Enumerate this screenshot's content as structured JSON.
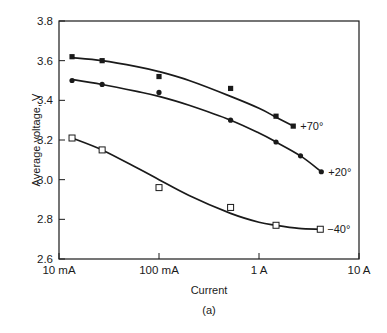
{
  "chart_data": {
    "type": "line",
    "title": "",
    "xlabel": "Current",
    "ylabel": "Average voltage, V",
    "caption": "(a)",
    "xscale": "log",
    "xlim_A": [
      0.01,
      10
    ],
    "ylim": [
      2.6,
      3.8
    ],
    "x_tick_labels": [
      "10 mA",
      "100 mA",
      "1 A",
      "10 A"
    ],
    "x_tick_values_A": [
      0.01,
      0.1,
      1,
      10
    ],
    "y_ticks": [
      2.6,
      2.8,
      3.0,
      3.2,
      3.4,
      3.6,
      3.8
    ],
    "y_tick_labels": [
      "2.6",
      "2.8",
      "3.0",
      "3.2",
      "3.4",
      "3.6",
      "3.8"
    ],
    "grid": false,
    "legend": "inline labels at end of each curve",
    "series": [
      {
        "name": "+70°",
        "marker": "filled-square",
        "points": [
          {
            "x_A": 0.0135,
            "y": 3.62
          },
          {
            "x_A": 0.027,
            "y": 3.6
          },
          {
            "x_A": 0.1,
            "y": 3.52
          },
          {
            "x_A": 0.52,
            "y": 3.46
          },
          {
            "x_A": 1.48,
            "y": 3.32
          },
          {
            "x_A": 2.2,
            "y": 3.27
          }
        ],
        "curve": [
          [
            0.0135,
            3.615
          ],
          [
            0.027,
            3.6
          ],
          [
            0.06,
            3.57
          ],
          [
            0.1,
            3.545
          ],
          [
            0.2,
            3.5
          ],
          [
            0.52,
            3.42
          ],
          [
            1.0,
            3.36
          ],
          [
            1.48,
            3.315
          ],
          [
            2.2,
            3.27
          ]
        ]
      },
      {
        "name": "+20°",
        "marker": "filled-circle",
        "points": [
          {
            "x_A": 0.0135,
            "y": 3.5
          },
          {
            "x_A": 0.027,
            "y": 3.48
          },
          {
            "x_A": 0.1,
            "y": 3.44
          },
          {
            "x_A": 0.52,
            "y": 3.3
          },
          {
            "x_A": 1.48,
            "y": 3.19
          },
          {
            "x_A": 2.6,
            "y": 3.12
          },
          {
            "x_A": 4.2,
            "y": 3.04
          }
        ],
        "curve": [
          [
            0.0135,
            3.505
          ],
          [
            0.027,
            3.48
          ],
          [
            0.06,
            3.445
          ],
          [
            0.1,
            3.42
          ],
          [
            0.2,
            3.375
          ],
          [
            0.52,
            3.3
          ],
          [
            1.0,
            3.235
          ],
          [
            1.48,
            3.19
          ],
          [
            2.6,
            3.12
          ],
          [
            4.2,
            3.04
          ]
        ]
      },
      {
        "name": "−40°",
        "marker": "open-square",
        "points": [
          {
            "x_A": 0.0135,
            "y": 3.21
          },
          {
            "x_A": 0.027,
            "y": 3.15
          },
          {
            "x_A": 0.1,
            "y": 2.96
          },
          {
            "x_A": 0.52,
            "y": 2.86
          },
          {
            "x_A": 1.48,
            "y": 2.77
          },
          {
            "x_A": 4.1,
            "y": 2.75
          }
        ],
        "curve": [
          [
            0.0135,
            3.21
          ],
          [
            0.027,
            3.15
          ],
          [
            0.06,
            3.06
          ],
          [
            0.1,
            3.0
          ],
          [
            0.2,
            2.92
          ],
          [
            0.52,
            2.83
          ],
          [
            1.0,
            2.785
          ],
          [
            1.48,
            2.77
          ],
          [
            2.5,
            2.755
          ],
          [
            4.1,
            2.75
          ]
        ]
      }
    ]
  },
  "labels": {
    "xlabel": "Current",
    "ylabel": "Average voltage, V",
    "caption": "(a)"
  }
}
